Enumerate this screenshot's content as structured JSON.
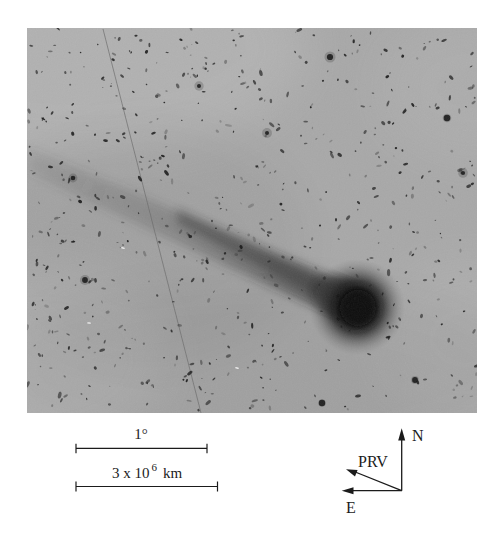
{
  "figure": {
    "photo": {
      "base_color": "#a8a8a8",
      "star_color": "#141414",
      "white_speck_color": "#f2f2f2",
      "star_count": 650,
      "seed": 20,
      "width": 450,
      "height": 385,
      "notable_stars": [
        [
          303,
          29
        ],
        [
          436,
          145
        ],
        [
          46,
          150
        ],
        [
          295,
          375
        ],
        [
          240,
          105
        ],
        [
          58,
          252
        ],
        [
          172,
          58
        ],
        [
          388,
          352
        ],
        [
          420,
          90
        ]
      ],
      "white_specks": [
        [
          96,
          220
        ],
        [
          62,
          295
        ],
        [
          210,
          340
        ]
      ]
    },
    "scale_bar_degrees": {
      "label": "1°"
    },
    "scale_bar_km": {
      "base": "3 x 10",
      "exponent": "6",
      "unit": "km"
    },
    "compass": {
      "north": "N",
      "east": "E",
      "vector": "PRV"
    },
    "ink_color": "#1b1b1b"
  }
}
